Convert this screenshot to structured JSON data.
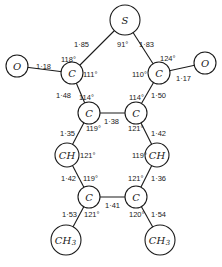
{
  "atoms": {
    "S": {
      "symbol": "S",
      "x": 125,
      "y": 20,
      "r": 15
    },
    "O1": {
      "symbol": "O",
      "x": 17,
      "y": 66,
      "r": 11
    },
    "C1": {
      "symbol": "C",
      "x": 72,
      "y": 73,
      "r": 11
    },
    "C2": {
      "symbol": "C",
      "x": 159,
      "y": 73,
      "r": 11
    },
    "O2": {
      "symbol": "O",
      "x": 205,
      "y": 63,
      "r": 11
    },
    "C3": {
      "symbol": "C",
      "x": 89,
      "y": 113,
      "r": 11
    },
    "C4": {
      "symbol": "C",
      "x": 136,
      "y": 113,
      "r": 11
    },
    "CH1": {
      "symbol": "CH",
      "x": 67,
      "y": 155,
      "r": 12
    },
    "CH2": {
      "symbol": "CH",
      "x": 157,
      "y": 155,
      "r": 12
    },
    "C5": {
      "symbol": "C",
      "x": 89,
      "y": 197,
      "r": 11
    },
    "C6": {
      "symbol": "C",
      "x": 136,
      "y": 197,
      "r": 11
    },
    "ME1": {
      "symbol": "CH",
      "sub": "3",
      "x": 66,
      "y": 240,
      "r": 15
    },
    "ME2": {
      "symbol": "CH",
      "sub": "3",
      "x": 160,
      "y": 240,
      "r": 15
    }
  },
  "bonds": [
    {
      "from": "S",
      "to": "C1",
      "length": "1·85"
    },
    {
      "from": "S",
      "to": "C2",
      "length": "1·83"
    },
    {
      "from": "O1",
      "to": "C1",
      "length": "1·18"
    },
    {
      "from": "C2",
      "to": "O2",
      "length": "1·17"
    },
    {
      "from": "C1",
      "to": "C3",
      "length": "1·48"
    },
    {
      "from": "C2",
      "to": "C4",
      "length": "1·50"
    },
    {
      "from": "C3",
      "to": "C4",
      "length": "1·38"
    },
    {
      "from": "C3",
      "to": "CH1",
      "length": "1·35"
    },
    {
      "from": "C4",
      "to": "CH2",
      "length": "1·42"
    },
    {
      "from": "CH1",
      "to": "C5",
      "length": "1·42"
    },
    {
      "from": "CH2",
      "to": "C6",
      "length": "1·36"
    },
    {
      "from": "C5",
      "to": "C6",
      "length": "1·41"
    },
    {
      "from": "C5",
      "to": "ME1",
      "length": "1·53"
    },
    {
      "from": "C6",
      "to": "ME2",
      "length": "1·54"
    }
  ],
  "labels": {
    "b_S_C1": "1·85",
    "b_S_C2": "1·83",
    "b_O1_C1": "1·18",
    "b_C2_O2": "1·17",
    "b_C1_C3": "1·48",
    "b_C2_C4": "1·50",
    "b_C3_C4": "1·38",
    "b_C3_CH1": "1·35",
    "b_C4_CH2": "1·42",
    "b_CH1_C5": "1·42",
    "b_CH2_C6": "1·36",
    "b_C5_C6": "1·41",
    "b_C5_ME1": "1·53",
    "b_C6_ME2": "1·54",
    "a_S": "91°",
    "a_C1_top": "118°",
    "a_C1_right": "111°",
    "a_C2_top": "124°",
    "a_C2_left": "110°",
    "a_C3_top": "114°",
    "a_C3_bottom": "119°",
    "a_C4_top": "114°",
    "a_C4_bottom": "121°",
    "a_CH1": "121°",
    "a_CH2": "119°",
    "a_C5_top": "119°",
    "a_C5_bottom": "121°",
    "a_C6_top": "121°",
    "a_C6_bottom": "120°"
  },
  "symbols": {
    "S": "S",
    "O1": "O",
    "O2": "O",
    "C1": "C",
    "C2": "C",
    "C3": "C",
    "C4": "C",
    "C5": "C",
    "C6": "C",
    "CH1": "CH",
    "CH2": "CH",
    "ME1": "CH",
    "ME2": "CH",
    "sub3": "3"
  }
}
